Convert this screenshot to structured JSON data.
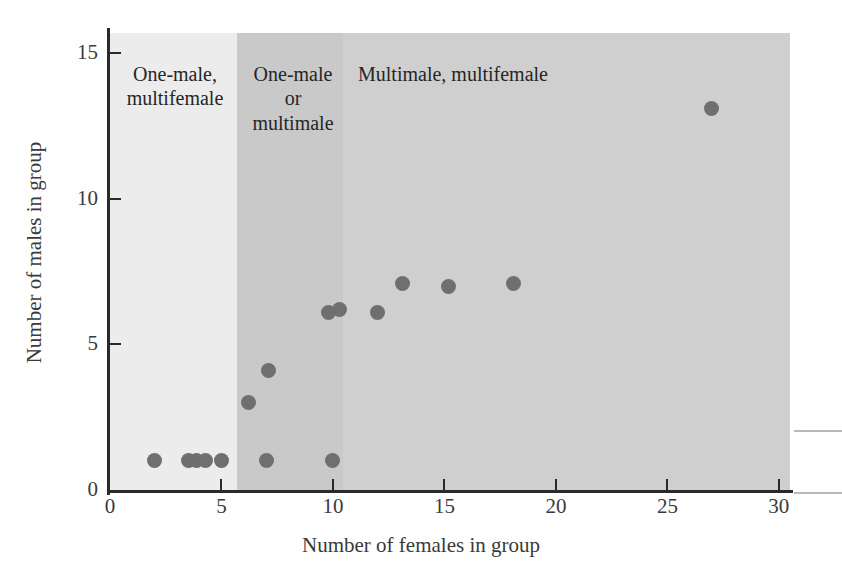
{
  "figure": {
    "background_color": "#ffffff",
    "point_color": "#6f6f6f"
  },
  "chart_data": {
    "type": "scatter",
    "title": "",
    "xlabel": "Number of females in group",
    "ylabel": "Number of males in group",
    "xlim": [
      0,
      30.5
    ],
    "ylim": [
      0,
      15.7
    ],
    "xticks": [
      0,
      5,
      10,
      15,
      20,
      25,
      30
    ],
    "xticklabels": [
      "0",
      "5",
      "10",
      "15",
      "20",
      "25",
      "30"
    ],
    "yticks": [
      0,
      5,
      10,
      15
    ],
    "yticklabels": [
      "0",
      "5",
      "10",
      "15"
    ],
    "grid": false,
    "legend": "none",
    "points": [
      {
        "x": 2.0,
        "y": 1
      },
      {
        "x": 3.5,
        "y": 1
      },
      {
        "x": 3.9,
        "y": 1
      },
      {
        "x": 4.3,
        "y": 1
      },
      {
        "x": 5.0,
        "y": 1
      },
      {
        "x": 7.0,
        "y": 1
      },
      {
        "x": 10.0,
        "y": 1
      },
      {
        "x": 6.2,
        "y": 3
      },
      {
        "x": 7.1,
        "y": 4.1
      },
      {
        "x": 9.8,
        "y": 6.1
      },
      {
        "x": 10.3,
        "y": 6.2
      },
      {
        "x": 12.0,
        "y": 6.1
      },
      {
        "x": 13.1,
        "y": 7.1
      },
      {
        "x": 15.2,
        "y": 7.0
      },
      {
        "x": 18.1,
        "y": 7.1
      },
      {
        "x": 27.0,
        "y": 13.1
      }
    ],
    "regions": [
      {
        "id": "one-male-multifemale",
        "label": "One-male,\nmultifemale",
        "x_start": 0,
        "x_end": 5.7,
        "color": "#ececec"
      },
      {
        "id": "one-male-or-multimale",
        "label": "One-male\nor\nmultimale",
        "x_start": 5.7,
        "x_end": 10.45,
        "color": "#c9c9c9"
      },
      {
        "id": "multimale-multifemale",
        "label": "Multimale, multifemale",
        "x_start": 10.45,
        "x_end": 30.5,
        "color": "#cfcfcf"
      }
    ]
  },
  "annotations": {
    "region_one_male_multifemale": "One-male,\nmultifemale",
    "region_one_male_or_multimale": "One-male\nor\nmultimale",
    "region_multimale_multifemale": "Multimale, multifemale"
  }
}
